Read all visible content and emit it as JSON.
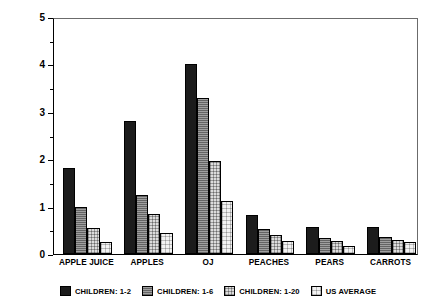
{
  "chart_data": {
    "type": "bar",
    "title": "",
    "xlabel": "",
    "ylabel": "MEAN INTAKE: G/KGBW/DAY",
    "ylim": [
      0,
      5
    ],
    "ytick_labels": [
      "0",
      "1",
      "2",
      "3",
      "4",
      "5"
    ],
    "ytick_values": [
      0,
      1,
      2,
      3,
      4,
      5
    ],
    "yminor_values": [
      0.5,
      1.5,
      2.5,
      3.5,
      4.5
    ],
    "grid": false,
    "legend_position": "bottom",
    "categories": [
      "APPLE JUICE",
      "APPLES",
      "OJ",
      "PEACHES",
      "PEARS",
      "CARROTS"
    ],
    "series": [
      {
        "name": "CHILDREN: 1-2",
        "swatch": "solid-black",
        "color": "#1c1c1c",
        "values": [
          1.82,
          2.8,
          4.0,
          0.82,
          0.57,
          0.58
        ]
      },
      {
        "name": "CHILDREN: 1-6",
        "swatch": "medium-gray-hatch",
        "color": "#8a8a8a",
        "values": [
          0.99,
          1.24,
          3.3,
          0.53,
          0.33,
          0.35
        ]
      },
      {
        "name": "CHILDREN: 1-20",
        "swatch": "light-gray-dot",
        "color": "#dcdcdc",
        "values": [
          0.55,
          0.84,
          1.96,
          0.4,
          0.28,
          0.3
        ]
      },
      {
        "name": "US AVERAGE",
        "swatch": "very-light-dot",
        "color": "#f2f2f2",
        "values": [
          0.25,
          0.44,
          1.12,
          0.27,
          0.16,
          0.25
        ]
      }
    ]
  }
}
